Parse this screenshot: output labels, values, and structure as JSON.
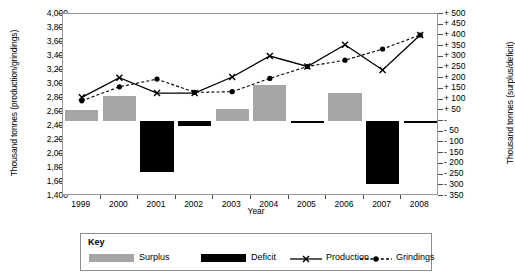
{
  "chart_data": {
    "type": "bar",
    "title": "",
    "xlabel": "Year",
    "ylabel_left": "Thousand tonnes (production/grindings)",
    "ylabel_right": "Thousand tonnes (surplus/deficit)",
    "categories": [
      "1999",
      "2000",
      "2001",
      "2002",
      "2003",
      "2004",
      "2005",
      "2006",
      "2007",
      "2008"
    ],
    "ylim_left": [
      1400,
      4000
    ],
    "ylim_right": [
      -350,
      500
    ],
    "ytick_step_left": 200,
    "ytick_step_right": 50,
    "yticks_left": [
      "1,400",
      "1,600",
      "1,800",
      "2,000",
      "2,200",
      "2,400",
      "2,600",
      "2,800",
      "3,000",
      "3,200",
      "3,400",
      "3,600",
      "3,800",
      "4,000"
    ],
    "yticks_right": [
      "- 350",
      "- 300",
      "- 250",
      "- 200",
      "- 150",
      "- 100",
      "- 50",
      "-",
      "+ 50",
      "+ 100",
      "+ 150",
      "+ 200",
      "+ 250",
      "+ 300",
      "+ 350",
      "+ 400",
      "+ 450",
      "+ 500"
    ],
    "grid": false,
    "legend_position": "bottom",
    "series": [
      {
        "name": "Surplus",
        "type": "bar",
        "axis": "right",
        "color": "#a6a6a6",
        "values": [
          50,
          115,
          0,
          0,
          55,
          170,
          0,
          130,
          0,
          0
        ]
      },
      {
        "name": "Deficit",
        "type": "bar",
        "axis": "right",
        "color": "#000000",
        "values": [
          0,
          0,
          -240,
          -25,
          0,
          0,
          -10,
          0,
          -295,
          -5
        ]
      },
      {
        "name": "Production",
        "type": "line",
        "axis": "left",
        "marker": "x",
        "dash": "solid",
        "color": "#000000",
        "values": [
          2810,
          3090,
          2870,
          2870,
          3100,
          3400,
          3250,
          3560,
          3200,
          3700
        ]
      },
      {
        "name": "Grindings",
        "type": "line",
        "axis": "left",
        "marker": "circle",
        "dash": "dashed",
        "color": "#000000",
        "values": [
          2760,
          2960,
          3070,
          2880,
          2890,
          3080,
          3250,
          3340,
          3500,
          3700
        ]
      }
    ]
  },
  "legend": {
    "title": "Key",
    "items": [
      {
        "label": "Surplus",
        "kind": "swatch",
        "color": "#a6a6a6"
      },
      {
        "label": "Deficit",
        "kind": "swatch",
        "color": "#000000"
      },
      {
        "label": "Production",
        "kind": "line-x",
        "color": "#000000"
      },
      {
        "label": "Grindings",
        "kind": "line-dot-dashed",
        "color": "#000000"
      }
    ]
  },
  "axes": {
    "x_title": "Year",
    "y_left_title": "Thousand tonnes (production/grindings)",
    "y_right_title": "Thousand tonnes (surplus/deficit)"
  }
}
